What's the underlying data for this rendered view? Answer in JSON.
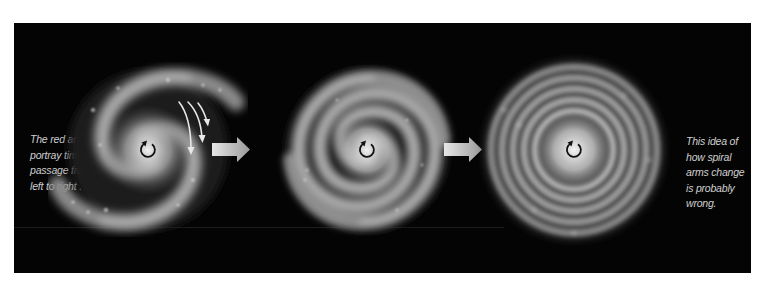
{
  "figure": {
    "background_color": "#040404",
    "left_caption": {
      "lines": [
        "The red arrows",
        "portray time's",
        "passage from",
        "left to right ."
      ]
    },
    "right_caption": {
      "lines": [
        "This idea of",
        "how spiral",
        "arms change",
        "is probably",
        "wrong."
      ]
    },
    "stages": [
      {
        "name": "loose-two-arm-spiral",
        "center": [
          148,
          150
        ],
        "rotation_icon": "counterclockwise-rotation-icon",
        "has_time_arrows": true,
        "time_arrow_count": 3
      },
      {
        "name": "tighter-wound-spiral",
        "center": [
          367,
          150
        ],
        "rotation_icon": "counterclockwise-rotation-icon"
      },
      {
        "name": "tightly-wound-ring-spiral",
        "center": [
          574,
          150
        ],
        "rotation_icon": "counterclockwise-rotation-icon"
      }
    ],
    "transition_arrows": [
      {
        "name": "stage-1-to-2-arrow",
        "color": "#d8d8d8"
      },
      {
        "name": "stage-2-to-3-arrow",
        "color": "#d8d8d8"
      }
    ]
  }
}
